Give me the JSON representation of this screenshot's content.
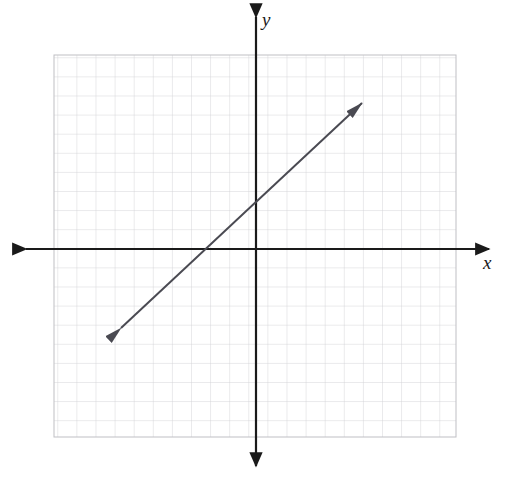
{
  "figure": {
    "kind": "coordinate-plane-graph",
    "width": 515,
    "height": 479,
    "background_color": "#ffffff"
  },
  "axes": {
    "x_label": "x",
    "y_label": "y",
    "x_axis_color": "#1a1a1a",
    "y_axis_color": "#1a1a1a",
    "origin_px": {
      "x": 256,
      "y": 249
    },
    "x_axis_y_px": 249,
    "y_axis_x_px": 256,
    "x_axis_left_tip_px": 26,
    "x_axis_right_tip_px": 489,
    "y_axis_top_tip_px": 17,
    "y_axis_bottom_tip_px": 466,
    "arrowheads": "both-ends-both-axes"
  },
  "grid": {
    "color": "#c9c9cd",
    "cell_size_px": 19.1,
    "left_px": 54,
    "top_px": 55,
    "right_px": 456,
    "bottom_px": 437,
    "columns": 21,
    "rows": 20,
    "show_border": true
  },
  "line": {
    "color": "#4a4a52",
    "stroke_width": 2,
    "arrowheads": "both-ends",
    "start_px": {
      "x": 121,
      "y": 328
    },
    "end_px": {
      "x": 362,
      "y": 103
    }
  },
  "chart_data": {
    "type": "line",
    "title": "",
    "subtitle": "",
    "xlabel": "x",
    "ylabel": "y",
    "grid": true,
    "legend": "none",
    "xlim": [
      -10.6,
      10.5
    ],
    "ylim": [
      -9.8,
      10.2
    ],
    "xticks": [
      -10,
      -9,
      -8,
      -7,
      -6,
      -5,
      -4,
      -3,
      -2,
      -1,
      0,
      1,
      2,
      3,
      4,
      5,
      6,
      7,
      8,
      9,
      10
    ],
    "yticks": [
      -9,
      -8,
      -7,
      -6,
      -5,
      -4,
      -3,
      -2,
      -1,
      0,
      1,
      2,
      3,
      4,
      5,
      6,
      7,
      8,
      9,
      10
    ],
    "tick_labels_shown": false,
    "series": [
      {
        "name": "line",
        "equation": "y = x + 2",
        "slope": 1,
        "intercept": 2,
        "x_intercept": -2,
        "y_intercept": 2,
        "x": [
          -7.1,
          5.5
        ],
        "values": [
          -4.1,
          7.5
        ],
        "endpoints_are_arrows": true,
        "color": "#4a4a52"
      }
    ],
    "annotations": []
  }
}
